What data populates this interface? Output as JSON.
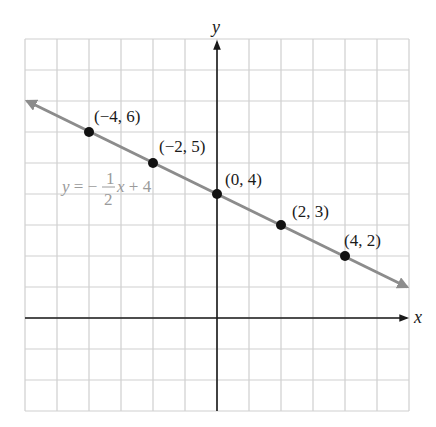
{
  "chart_data": {
    "type": "line",
    "title": "",
    "xlabel": "x",
    "ylabel": "y",
    "xlim": [
      -6,
      6
    ],
    "ylim": [
      -3,
      9
    ],
    "grid": true,
    "tick_labels_shown": false,
    "series": [
      {
        "name": "y = -1/2 x + 4",
        "equation": {
          "prefix": "y = −",
          "numerator": "1",
          "denominator": "2",
          "suffix": "x + 4"
        },
        "slope": -0.5,
        "intercept": 4,
        "color": "#8c8c8c",
        "arrows_both_ends": true,
        "points": [
          {
            "x": -4,
            "y": 6,
            "label": "(−4, 6)"
          },
          {
            "x": -2,
            "y": 5,
            "label": "(−2, 5)"
          },
          {
            "x": 0,
            "y": 4,
            "label": "(0, 4)"
          },
          {
            "x": 2,
            "y": 3,
            "label": "(2, 3)"
          },
          {
            "x": 4,
            "y": 2,
            "label": "(4, 2)"
          }
        ]
      }
    ]
  },
  "layout": {
    "origin_px": [
      217,
      318
    ],
    "unit_px": [
      32,
      31
    ],
    "grid_left": 25,
    "grid_top": 39,
    "grid_cols": 12,
    "grid_rows": 12,
    "label_offsets": [
      [
        5,
        -10
      ],
      [
        6,
        -11
      ],
      [
        8,
        -9
      ],
      [
        11,
        -8
      ],
      [
        -1,
        -10
      ]
    ],
    "equation_pos": [
      62,
      192
    ]
  }
}
